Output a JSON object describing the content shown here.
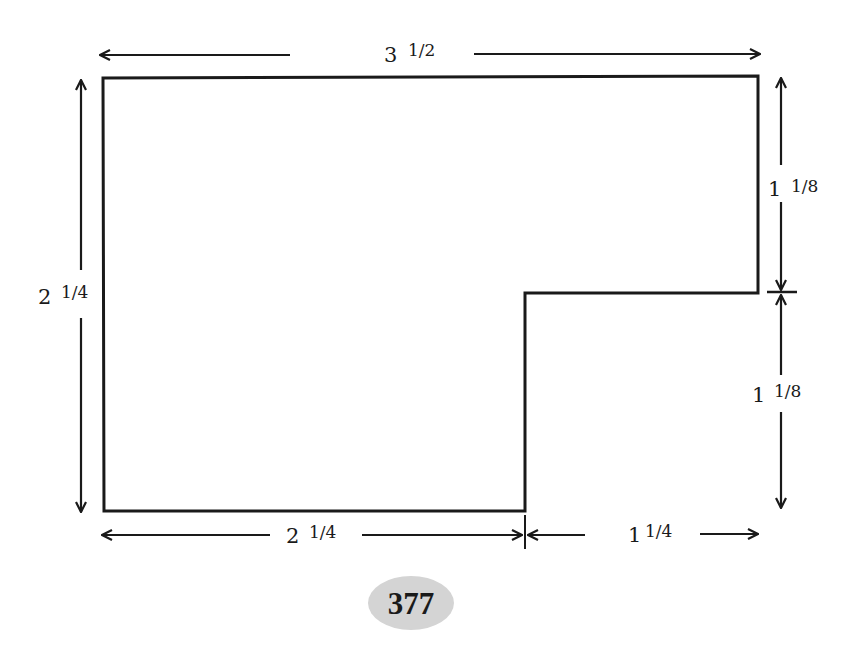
{
  "diagram": {
    "shape": "L-shaped polygon (rectangle with lower-right notch)",
    "dimensions": {
      "top_width": {
        "whole": "3",
        "fraction": "1/2"
      },
      "left_height": {
        "whole": "2",
        "fraction": "1/4"
      },
      "right_upper_height": {
        "whole": "1",
        "fraction": "1/8"
      },
      "right_lower_height": {
        "whole": "1",
        "fraction": "1/8"
      },
      "bottom_left_width": {
        "whole": "2",
        "fraction": "1/4"
      },
      "bottom_right_width": {
        "whole": "1",
        "fraction": "1/4"
      }
    },
    "colors": {
      "stroke": "#1a1a1a",
      "background": "#ffffff",
      "page_badge": "#d4d4d4"
    }
  },
  "page": {
    "number": "377"
  }
}
